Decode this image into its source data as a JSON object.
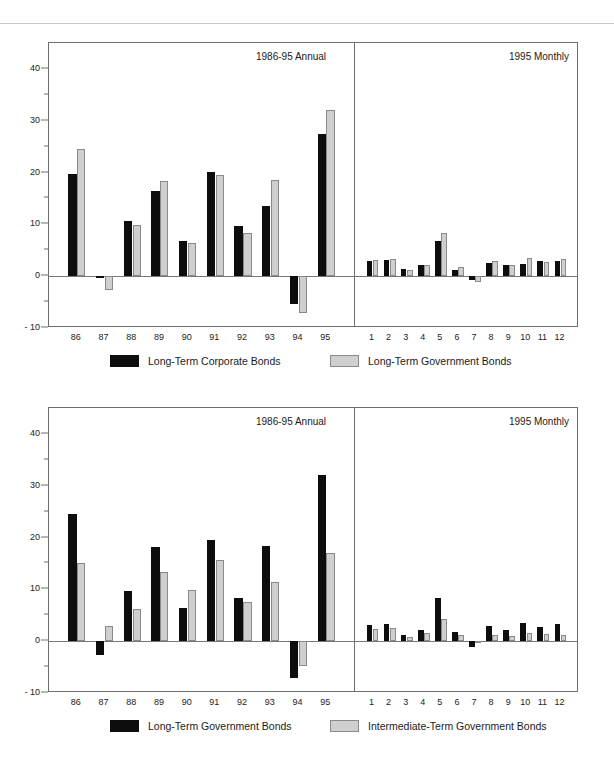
{
  "page": {
    "ghost_text": "· ·   ·",
    "background": "#ffffff"
  },
  "colors": {
    "series_dark": "#0d0d0d",
    "series_light": "#cfcfcf",
    "axis": "#6e6e6e",
    "text": "#1a1a1a"
  },
  "charts": [
    {
      "id": "chart-top",
      "annual_caption": "1986-95 Annual",
      "monthly_caption": "1995 Monthly",
      "legend": [
        {
          "label": "Long-Term Corporate Bonds",
          "swatch": "dark"
        },
        {
          "label": "Long-Term Government Bonds",
          "swatch": "light"
        }
      ]
    },
    {
      "id": "chart-bottom",
      "annual_caption": "1986-95 Annual",
      "monthly_caption": "1995 Monthly",
      "legend": [
        {
          "label": "Long-Term Government Bonds",
          "swatch": "dark"
        },
        {
          "label": "Intermediate-Term Government Bonds",
          "swatch": "light"
        }
      ]
    }
  ],
  "chart_data": [
    {
      "type": "bar",
      "id": "chart-top",
      "title": "Long-Term Corporate vs Long-Term Government Bonds",
      "xlabel": "",
      "ylabel": "",
      "ylim": [
        -10,
        45
      ],
      "ytick_labels": [
        "40",
        "30",
        "20",
        "10",
        "0",
        "- 10"
      ],
      "yticks": [
        40,
        30,
        20,
        10,
        0,
        -10
      ],
      "yticks_minor": [
        35,
        25,
        15,
        5,
        -5
      ],
      "grid": false,
      "legend_position": "bottom",
      "panels": [
        {
          "name": "1986-95 Annual",
          "categories": [
            "86",
            "87",
            "88",
            "89",
            "90",
            "91",
            "92",
            "93",
            "94",
            "95"
          ],
          "series": [
            {
              "name": "Long-Term Corporate Bonds",
              "color": "dark",
              "values": [
                19.8,
                -0.3,
                10.7,
                16.4,
                6.8,
                20.2,
                9.6,
                13.5,
                -5.3,
                27.5
              ]
            },
            {
              "name": "Long-Term Government Bonds",
              "color": "light",
              "values": [
                24.5,
                -2.7,
                9.8,
                18.3,
                6.4,
                19.5,
                8.3,
                18.6,
                -7.2,
                32.0
              ]
            }
          ]
        },
        {
          "name": "1995 Monthly",
          "categories": [
            "1",
            "2",
            "3",
            "4",
            "5",
            "6",
            "7",
            "8",
            "9",
            "10",
            "11",
            "12"
          ],
          "series": [
            {
              "name": "Long-Term Corporate Bonds",
              "color": "dark",
              "values": [
                2.9,
                3.2,
                1.3,
                2.2,
                6.7,
                1.2,
                -0.8,
                2.6,
                2.1,
                2.4,
                3.0,
                2.9
              ]
            },
            {
              "name": "Long-Term Government Bonds",
              "color": "light",
              "values": [
                3.1,
                3.3,
                1.2,
                2.1,
                8.3,
                1.8,
                -1.2,
                2.9,
                2.2,
                3.6,
                2.8,
                3.3
              ]
            }
          ]
        }
      ]
    },
    {
      "type": "bar",
      "id": "chart-bottom",
      "title": "Long-Term vs Intermediate-Term Government Bonds",
      "xlabel": "",
      "ylabel": "",
      "ylim": [
        -10,
        45
      ],
      "ytick_labels": [
        "40",
        "30",
        "20",
        "10",
        "0",
        "- 10"
      ],
      "yticks": [
        40,
        30,
        20,
        10,
        0,
        -10
      ],
      "yticks_minor": [
        35,
        25,
        15,
        5,
        -5
      ],
      "grid": false,
      "legend_position": "bottom",
      "panels": [
        {
          "name": "1986-95 Annual",
          "categories": [
            "86",
            "87",
            "88",
            "89",
            "90",
            "91",
            "92",
            "93",
            "94",
            "95"
          ],
          "series": [
            {
              "name": "Long-Term Government Bonds",
              "color": "dark",
              "values": [
                24.5,
                -2.7,
                9.7,
                18.2,
                6.4,
                19.5,
                8.3,
                18.4,
                -7.2,
                32.0
              ]
            },
            {
              "name": "Intermediate-Term Government Bonds",
              "color": "light",
              "values": [
                15.1,
                3.0,
                6.2,
                13.3,
                9.9,
                15.6,
                7.5,
                11.5,
                -4.7,
                17.0
              ]
            }
          ]
        },
        {
          "name": "1995 Monthly",
          "categories": [
            "1",
            "2",
            "3",
            "4",
            "5",
            "6",
            "7",
            "8",
            "9",
            "10",
            "11",
            "12"
          ],
          "series": [
            {
              "name": "Long-Term Government Bonds",
              "color": "dark",
              "values": [
                3.1,
                3.3,
                1.2,
                2.1,
                8.3,
                1.8,
                -1.2,
                2.9,
                2.2,
                3.6,
                2.8,
                3.3
              ]
            },
            {
              "name": "Intermediate-Term Government Bonds",
              "color": "light",
              "values": [
                2.4,
                2.5,
                0.8,
                1.5,
                4.2,
                1.2,
                0.1,
                1.1,
                1.0,
                1.6,
                1.3,
                1.2
              ]
            }
          ]
        }
      ]
    }
  ]
}
